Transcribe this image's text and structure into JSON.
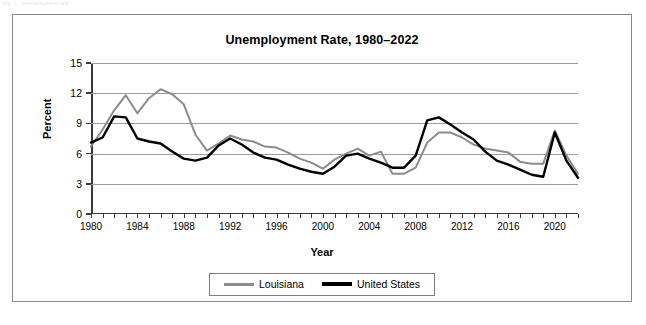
{
  "page": {
    "faint_header": "Fig. 1. Unemployment rate"
  },
  "chart": {
    "title": "Unemployment Rate, 1980–2022",
    "xlabel": "Year",
    "ylabel": "Percent"
  },
  "legend": {
    "position": "bottom-center",
    "entries": [
      {
        "label": "Louisiana",
        "color": "#8c8c8c",
        "swatch": "louisiana-line-swatch"
      },
      {
        "label": "United States",
        "color": "#000000",
        "swatch": "united-states-line-swatch"
      }
    ]
  },
  "chart_data": {
    "type": "line",
    "title": "Unemployment Rate, 1980–2022",
    "xlabel": "Year",
    "ylabel": "Percent",
    "xlim": [
      1980,
      2022
    ],
    "ylim": [
      0,
      15
    ],
    "yticks": [
      0,
      3,
      6,
      9,
      12,
      15
    ],
    "xticks": [
      1980,
      1984,
      1988,
      1992,
      1996,
      2000,
      2004,
      2008,
      2012,
      2016,
      2020
    ],
    "xtick_labels": [
      "1980",
      "1984",
      "1988",
      "1992",
      "1996",
      "2000",
      "2004",
      "2008",
      "2012",
      "2016",
      "2020"
    ],
    "ytick_labels": [
      "0",
      "3",
      "6",
      "9",
      "12",
      "15"
    ],
    "grid": "horizontal",
    "legend_position": "bottom-center",
    "x": [
      1980,
      1981,
      1982,
      1983,
      1984,
      1985,
      1986,
      1987,
      1988,
      1989,
      1990,
      1991,
      1992,
      1993,
      1994,
      1995,
      1996,
      1997,
      1998,
      1999,
      2000,
      2001,
      2002,
      2003,
      2004,
      2005,
      2006,
      2007,
      2008,
      2009,
      2010,
      2011,
      2012,
      2013,
      2014,
      2015,
      2016,
      2017,
      2018,
      2019,
      2020,
      2021,
      2022
    ],
    "series": [
      {
        "name": "Louisiana",
        "color": "#8c8c8c",
        "values": [
          6.7,
          8.4,
          10.3,
          11.8,
          10.0,
          11.5,
          12.4,
          11.9,
          10.9,
          7.9,
          6.3,
          7.0,
          7.8,
          7.4,
          7.2,
          6.7,
          6.6,
          6.1,
          5.5,
          5.1,
          4.5,
          5.4,
          6.0,
          6.5,
          5.8,
          6.2,
          4.0,
          4.0,
          4.6,
          7.1,
          8.1,
          8.1,
          7.6,
          6.9,
          6.5,
          6.3,
          6.1,
          5.2,
          5.0,
          5.0,
          8.3,
          5.8,
          4.0
        ]
      },
      {
        "name": "United States",
        "color": "#000000",
        "values": [
          7.1,
          7.6,
          9.7,
          9.6,
          7.5,
          7.2,
          7.0,
          6.2,
          5.5,
          5.3,
          5.6,
          6.8,
          7.5,
          6.9,
          6.1,
          5.6,
          5.4,
          4.9,
          4.5,
          4.2,
          4.0,
          4.7,
          5.8,
          6.0,
          5.5,
          5.1,
          4.6,
          4.6,
          5.8,
          9.3,
          9.6,
          8.9,
          8.1,
          7.4,
          6.2,
          5.3,
          4.9,
          4.4,
          3.9,
          3.7,
          8.1,
          5.3,
          3.6
        ]
      }
    ]
  }
}
